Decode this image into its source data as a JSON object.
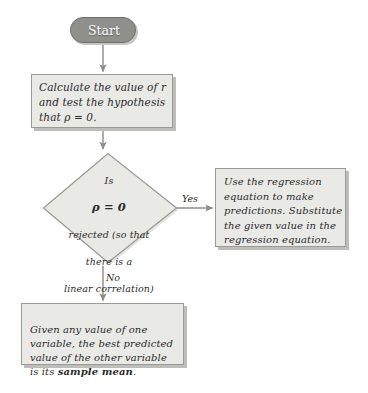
{
  "figure": {
    "type": "flowchart",
    "orientation": "top-down",
    "background_color": "#ffffff"
  },
  "style": {
    "node_fill": "#e9e9e6",
    "node_border": "#9a9a96",
    "node_shadow": "#bdbdb9",
    "start_fill": "#8f8f8c",
    "start_text_color": "#ffffff",
    "connector_color": "#8c8c89",
    "text_color": "#2b2b2b"
  },
  "nodes": {
    "start": {
      "label": "Start",
      "shape": "rounded-pill"
    },
    "calculate": {
      "label": "Calculate the value of r\nand test the hypothesis\nthat ρ = 0.",
      "shape": "rectangle"
    },
    "decision": {
      "shape": "diamond",
      "line1": "Is",
      "line2": "ρ = 0",
      "line3": "rejected (so that",
      "line4": "there is a",
      "line5": "linear correlation)",
      "line6": "?"
    },
    "regression": {
      "label": "Use the regression\nequation to make\npredictions. Substitute\nthe given value in the\nregression equation.",
      "shape": "rectangle"
    },
    "sample_mean": {
      "text_before": "Given any value of one\nvariable, the best predicted\nvalue of the other variable\nis its ",
      "emphasis": "sample mean",
      "text_after": ".",
      "shape": "rectangle"
    }
  },
  "edges": {
    "start_to_calculate": {
      "label": ""
    },
    "calculate_to_decision": {
      "label": ""
    },
    "decision_to_regression": {
      "label": "Yes"
    },
    "decision_to_sample_mean": {
      "label": "No"
    }
  }
}
